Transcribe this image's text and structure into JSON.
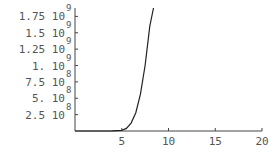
{
  "chart_data": {
    "type": "line",
    "title": "",
    "xlabel": "",
    "ylabel": "",
    "xlim": [
      0,
      20
    ],
    "ylim": [
      0,
      2000000000
    ],
    "grid": false,
    "legend": null,
    "x_ticks": [
      "5",
      "10",
      "15",
      "20"
    ],
    "y_ticks": [
      {
        "mantissa": "2.5",
        "base": "10",
        "exp": "8",
        "value": 250000000
      },
      {
        "mantissa": "5.",
        "base": "10",
        "exp": "8",
        "value": 500000000
      },
      {
        "mantissa": "7.5",
        "base": "10",
        "exp": "8",
        "value": 750000000
      },
      {
        "mantissa": "1.",
        "base": "10",
        "exp": "9",
        "value": 1000000000
      },
      {
        "mantissa": "1.25",
        "base": "10",
        "exp": "9",
        "value": 1250000000
      },
      {
        "mantissa": "1.5",
        "base": "10",
        "exp": "9",
        "value": 1500000000
      },
      {
        "mantissa": "1.75",
        "base": "10",
        "exp": "9",
        "value": 1750000000
      }
    ],
    "series": [
      {
        "name": "f(x)",
        "x": [
          0,
          2,
          4,
          5,
          5.5,
          6,
          6.5,
          7,
          7.5,
          8,
          8.4
        ],
        "y": [
          0,
          0,
          1000000,
          10000000,
          40000000,
          120000000,
          280000000,
          560000000,
          1000000000,
          1600000000,
          2000000000
        ]
      }
    ]
  }
}
